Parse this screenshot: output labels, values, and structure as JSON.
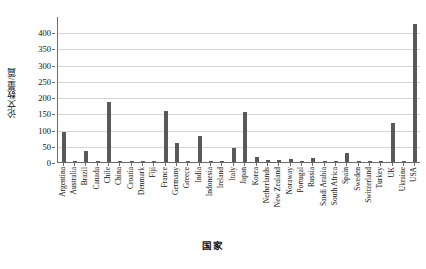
{
  "chart_data": {
    "type": "bar",
    "title": "",
    "xlabel": "国家",
    "ylabel": "论文数量/篇",
    "ylim": [
      0,
      450
    ],
    "ytick_interval": 50,
    "yticks": [
      0,
      50,
      100,
      150,
      200,
      250,
      300,
      350,
      400
    ],
    "grid": true,
    "legend": false,
    "bar_color": "#595959",
    "categories": [
      "Argentina",
      "Australia",
      "Brazil",
      "Canada",
      "Chile",
      "China",
      "Croatia",
      "Denmark",
      "Fiji",
      "France",
      "Germany",
      "Greece",
      "India",
      "Indonesia",
      "Ireland",
      "Italy",
      "Japan",
      "Korea",
      "Netherlands",
      "New Zealand",
      "Noraway",
      "Portugal",
      "Russia",
      "Saudi Arabia",
      "South Africa",
      "Spain",
      "Sweden",
      "Switzerland",
      "Turkey",
      "UK",
      "Ukraine",
      "USA"
    ],
    "values": [
      93,
      2,
      35,
      1,
      185,
      2,
      1,
      2,
      1,
      156,
      60,
      2,
      80,
      1,
      1,
      42,
      153,
      17,
      6,
      7,
      9,
      3,
      13,
      1,
      2,
      29,
      1,
      1,
      1,
      120,
      2,
      425
    ]
  }
}
